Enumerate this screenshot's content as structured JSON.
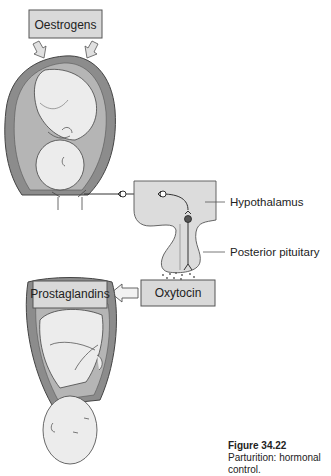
{
  "diagram": {
    "boxes": {
      "oestrogens": "Oestrogens",
      "prostaglandins": "Prostaglandins",
      "oxytocin": "Oxytocin"
    },
    "labels": {
      "hypothalamus": "Hypothalamus",
      "posterior_pituitary": "Posterior pituitary"
    },
    "colors": {
      "box_fill": "#d9d9d9",
      "box_stroke": "#555555",
      "uterus_wall": "#8c8c8c",
      "fetus_fill": "#ececec",
      "brain_fill": "#dcdcdc"
    }
  },
  "caption": {
    "figure_number": "Figure 34.22",
    "text": "Parturition: hormonal control."
  }
}
